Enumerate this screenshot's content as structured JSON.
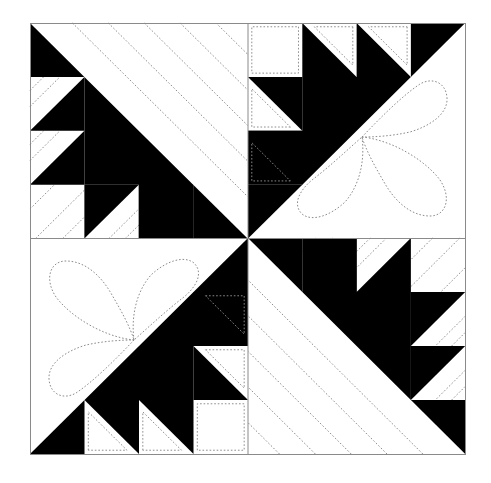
{
  "diagram": {
    "layout": {
      "block_left": 30,
      "block_top": 23,
      "block_width": 435,
      "block_height": 431,
      "grid_units_per_quadrant": 4
    },
    "colors": {
      "dark_fabric": "#000000",
      "light_fabric": "#ffffff",
      "frame": "#8a8a8a",
      "quilting": "#8c8c8c",
      "background": "#ffffff"
    },
    "quadrants": [
      {
        "position": "top-left",
        "rotation_deg": 0,
        "quilting": "diagonal-lines"
      },
      {
        "position": "top-right",
        "rotation_deg": 90,
        "quilting": "flower"
      },
      {
        "position": "bottom-right",
        "rotation_deg": 180,
        "quilting": "diagonal-lines"
      },
      {
        "position": "bottom-left",
        "rotation_deg": 270,
        "quilting": "flower"
      }
    ]
  }
}
